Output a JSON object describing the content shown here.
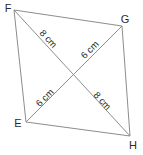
{
  "figure": {
    "colors": {
      "background": "#ffffff",
      "line": "#8d8d8d",
      "text": "#2b2b2b"
    },
    "vertices": [
      {
        "id": "F",
        "label": "F"
      },
      {
        "id": "G",
        "label": "G"
      },
      {
        "id": "H",
        "label": "H"
      },
      {
        "id": "E",
        "label": "E"
      }
    ],
    "measurements": [
      {
        "segment": "F-to-centre (diagonal FH)",
        "label": "8 cm"
      },
      {
        "segment": "G-to-centre (diagonal GE)",
        "label": "6 cm"
      },
      {
        "segment": "E-to-centre (diagonal EG)",
        "label": "6 cm"
      },
      {
        "segment": "centre-to-H (diagonal FH)",
        "label": "8 cm"
      }
    ]
  }
}
